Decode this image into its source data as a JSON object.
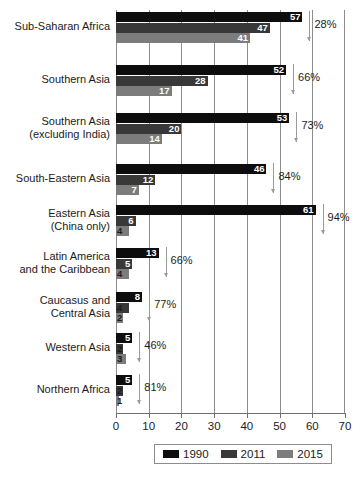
{
  "chart_data": {
    "type": "bar",
    "orientation": "horizontal",
    "title": "",
    "xlabel": "",
    "ylabel": "",
    "xlim": [
      0,
      70
    ],
    "xticks": [
      0,
      10,
      20,
      30,
      40,
      50,
      60,
      70
    ],
    "grid": true,
    "legend_position": "bottom",
    "categories": [
      "Sub-Saharan Africa",
      "Southern Asia",
      "Southern Asia\n(excluding India)",
      "South-Eastern Asia",
      "Eastern Asia\n(China only)",
      "Latin America\nand the Caribbean",
      "Caucasus and\nCentral Asia",
      "Western Asia",
      "Northern Africa"
    ],
    "series": [
      {
        "name": "1990",
        "color": "#0d0d0d",
        "values": [
          57,
          52,
          53,
          46,
          61,
          13,
          8,
          5,
          5
        ]
      },
      {
        "name": "2011",
        "color": "#383838",
        "values": [
          47,
          28,
          20,
          12,
          6,
          5,
          4,
          2,
          2
        ]
      },
      {
        "name": "2015",
        "color": "#7c7c7c",
        "values": [
          41,
          17,
          14,
          7,
          4,
          4,
          2,
          3,
          1
        ]
      }
    ],
    "annotations": [
      {
        "category": "Sub-Saharan Africa",
        "text": "28%"
      },
      {
        "category": "Southern Asia",
        "text": "66%"
      },
      {
        "category": "Southern Asia (excluding India)",
        "text": "73%"
      },
      {
        "category": "South-Eastern Asia",
        "text": "84%"
      },
      {
        "category": "Eastern Asia (China only)",
        "text": "94%"
      },
      {
        "category": "Latin America and the Caribbean",
        "text": "66%"
      },
      {
        "category": "Caucasus and Central Asia",
        "text": "77%"
      },
      {
        "category": "Western Asia",
        "text": "46%"
      },
      {
        "category": "Northern Africa",
        "text": "81%"
      }
    ]
  },
  "category_labels": [
    {
      "lines": [
        "Sub-Saharan Africa"
      ]
    },
    {
      "lines": [
        "Southern Asia"
      ]
    },
    {
      "lines": [
        "Southern Asia",
        "(excluding India)"
      ]
    },
    {
      "lines": [
        "South-Eastern Asia"
      ]
    },
    {
      "lines": [
        "Eastern Asia",
        "(China only)"
      ]
    },
    {
      "lines": [
        "Latin America",
        "and the Caribbean"
      ]
    },
    {
      "lines": [
        "Caucasus and",
        "Central Asia"
      ]
    },
    {
      "lines": [
        "Western Asia"
      ]
    },
    {
      "lines": [
        "Northern Africa"
      ]
    }
  ],
  "legend": {
    "items": [
      {
        "label": "1990",
        "color": "#0d0d0d"
      },
      {
        "label": "2011",
        "color": "#383838"
      },
      {
        "label": "2015",
        "color": "#7c7c7c"
      }
    ]
  }
}
